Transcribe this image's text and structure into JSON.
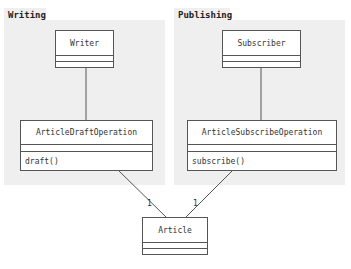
{
  "packages": [
    {
      "id": "writing",
      "label": "Writing"
    },
    {
      "id": "publishing",
      "label": "Publishing"
    }
  ],
  "classes": {
    "writer": {
      "name": "Writer",
      "operations": []
    },
    "subscriber": {
      "name": "Subscriber",
      "operations": []
    },
    "article_draft_operation": {
      "name": "ArticleDraftOperation",
      "operations": [
        "draft()"
      ]
    },
    "article_subscribe_operation": {
      "name": "ArticleSubscribeOperation",
      "operations": [
        "subscribe()"
      ]
    },
    "article": {
      "name": "Article",
      "operations": []
    }
  },
  "associations": [
    {
      "from": "Writer",
      "to": "ArticleDraftOperation",
      "multiplicity": ""
    },
    {
      "from": "Subscriber",
      "to": "ArticleSubscribeOperation",
      "multiplicity": ""
    },
    {
      "from": "ArticleDraftOperation",
      "to": "Article",
      "multiplicity": "1"
    },
    {
      "from": "ArticleSubscribeOperation",
      "to": "Article",
      "multiplicity": "1"
    }
  ],
  "colors": {
    "package_fill": "#efefef",
    "class_border": "#555555",
    "line": "#555555"
  }
}
